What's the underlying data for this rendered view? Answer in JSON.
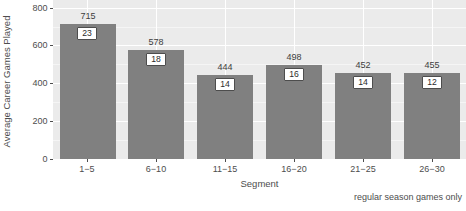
{
  "chart_data": {
    "type": "bar",
    "title": "First-Round Selections between 2000 and 2009 NBA Drafts",
    "subtitle": "",
    "caption": "regular season games only",
    "xlabel": "Segment",
    "ylabel": "Average Career Games Played",
    "categories": [
      "1−5",
      "6−10",
      "11−15",
      "16−20",
      "21−25",
      "26−30"
    ],
    "values": [
      715,
      578,
      444,
      498,
      452,
      455
    ],
    "value_labels": [
      "715",
      "578",
      "444",
      "498",
      "452",
      "455"
    ],
    "box_labels": [
      "23",
      "18",
      "14",
      "16",
      "14",
      "12"
    ],
    "ylim": [
      0,
      840
    ],
    "ytick_values": [
      0,
      200,
      400,
      600,
      800
    ],
    "ytick_labels": [
      "0",
      "200",
      "400",
      "600",
      "800"
    ],
    "grid": true,
    "legend": "none",
    "bar_color": "#808080",
    "panel_color": "#ebebeb",
    "gridline_color": "#ffffff",
    "text_color": "#4d4d4d"
  }
}
